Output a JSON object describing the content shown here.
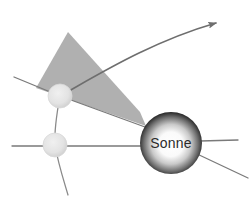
{
  "figure": {
    "title": "Sonne",
    "background_color": "#ffffff",
    "width": 252,
    "height": 203
  },
  "sun": {
    "label": "Sonne",
    "center_x": 171,
    "center_y": 143,
    "radius": 31,
    "edge_color": "#2e2e2e",
    "mid_color": "#8c8c8c",
    "core_color": "#ffffff",
    "label_color": "#2b2b2b"
  },
  "wedge": {
    "name": "light-cone",
    "fill_color": "#b0b0b0",
    "points": "68,32 36,88 146,126 140,112"
  },
  "planets": [
    {
      "name": "planet-upper",
      "center_x": 60,
      "center_y": 96,
      "radius": 12,
      "fill_color": "#e2e2e2",
      "rim_color": "#d3d3d3"
    },
    {
      "name": "planet-lower",
      "center_x": 55,
      "center_y": 145,
      "radius": 12,
      "fill_color": "#e2e2e2",
      "rim_color": "#d3d3d3"
    }
  ],
  "trajectory": {
    "name": "curved-arrow",
    "path": "M 60,96 C 96,76 150,42 216,23",
    "stroke_color": "#6e6e6e",
    "stroke_width": 1.6,
    "arrow_tip_x": 221,
    "arrow_tip_y": 21
  },
  "rays": [
    {
      "name": "ray-upper-left",
      "path": "M 14,77 L 60,96",
      "stroke_color": "#7a7a7a",
      "stroke_width": 1.3
    },
    {
      "name": "ray-upper-to-sun",
      "path": "M 60,96 L 145,127",
      "stroke_color": "#7a7a7a",
      "stroke_width": 1.3
    },
    {
      "name": "ray-horizontal-lower",
      "path": "M 12,146 L 148,146",
      "stroke_color": "#7a7a7a",
      "stroke_width": 1.3
    },
    {
      "name": "ray-sun-lower-right",
      "path": "M 195,153 L 248,178",
      "stroke_color": "#7a7a7a",
      "stroke_width": 1.3
    },
    {
      "name": "ray-sun-right-horizontal",
      "path": "M 200,141 L 238,140",
      "stroke_color": "#7a7a7a",
      "stroke_width": 1.3
    },
    {
      "name": "orbit-segment-between-planets",
      "path": "M 60,96 C 57,112 54,128 55,145",
      "stroke_color": "#8a8a8a",
      "stroke_width": 1.3
    },
    {
      "name": "orbit-segment-below-lower-planet",
      "path": "M 55,145 C 58,163 63,178 68,195",
      "stroke_color": "#8a8a8a",
      "stroke_width": 1.3
    }
  ]
}
